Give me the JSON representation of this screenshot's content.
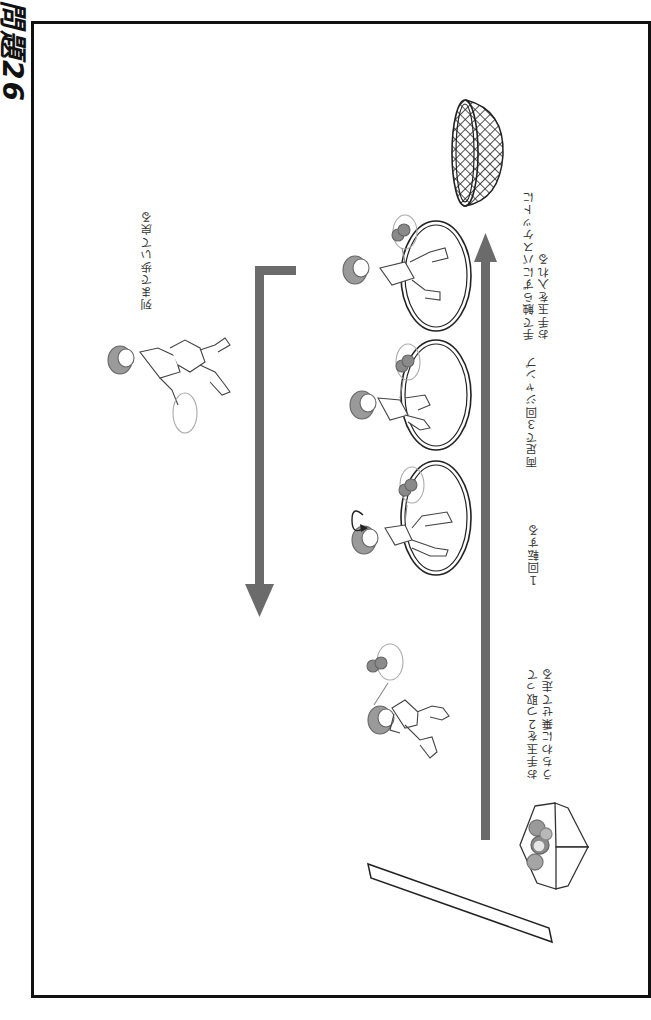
{
  "title": "問題26",
  "orientation": "rotated 90° (landscape page shown portrait)",
  "labels": {
    "return_walk": "列まで歩いて戻る",
    "basket_instruction_line1": "手で触らずにバスケットに",
    "basket_instruction_line2": "お手玉を入れる",
    "jump": "両足で３回ジャンプ",
    "spin": "１回転する",
    "start_line1": "お手玉を２つ取って",
    "start_line2": "うちわに乗せて走る"
  },
  "elements": {
    "main_arrow": {
      "direction": "toward basket",
      "color": "#6b6b6b"
    },
    "return_arrow": {
      "direction": "back to line",
      "color": "#6b6b6b"
    },
    "hoops": [
      {
        "index": 1,
        "action": "spin"
      },
      {
        "index": 2,
        "action": "jump"
      },
      {
        "index": 3,
        "action": "walk through"
      }
    ],
    "props": [
      "basket",
      "beanbag-box",
      "start-line"
    ],
    "figures": [
      {
        "pose": "running with fan and beanbags"
      },
      {
        "pose": "spinning in hoop"
      },
      {
        "pose": "jumping in hoop"
      },
      {
        "pose": "stepping through hoop"
      },
      {
        "pose": "walking back with fan"
      }
    ]
  },
  "colors": {
    "arrow": "#6b6b6b",
    "line": "#222222",
    "beanbag": "#8a8a8a",
    "hair": "#9a9a9a"
  }
}
